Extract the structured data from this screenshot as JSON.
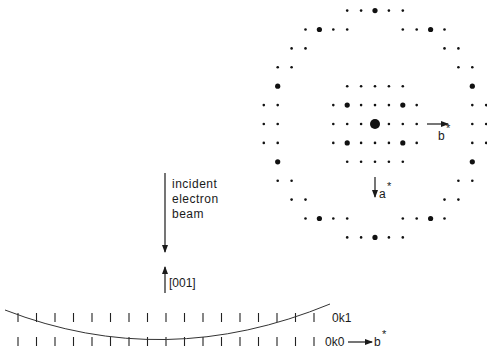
{
  "diagram": {
    "labels": {
      "beam_line1": "incident",
      "beam_line2": "electron",
      "beam_line3": "beam",
      "zone_axis": "[001]",
      "upper_row": "0k1",
      "lower_row": "0k0",
      "b_star_bottom": "b",
      "b_star_bottom_sup": "*",
      "b_star_pattern": "b",
      "b_star_pattern_sup": "*",
      "a_star_pattern": "a",
      "a_star_pattern_sup": "*"
    },
    "pattern": {
      "center": [
        375,
        124
      ],
      "col_spacing": 13.9,
      "row_spacing": 18.9,
      "description": "Electron diffraction pattern: central 0k0 zone (inner square grid) surrounded by a ring of first-order Laue zone reflections",
      "spots": [
        {
          "row": -6,
          "cols": [
            -2,
            -1,
            0,
            1,
            2
          ],
          "strong": [
            0
          ]
        },
        {
          "row": -5,
          "cols": [
            -5,
            -4,
            -3,
            -2,
            2,
            3,
            4,
            5
          ],
          "strong": [
            -4,
            4
          ]
        },
        {
          "row": -4,
          "cols": [
            -6,
            -5,
            5,
            6
          ],
          "strong": []
        },
        {
          "row": -3,
          "cols": [
            -7,
            -6,
            6,
            7
          ],
          "strong": []
        },
        {
          "row": -2,
          "cols": [
            -7,
            -2,
            -1,
            0,
            1,
            2,
            7
          ],
          "strong": [
            -7,
            7
          ]
        },
        {
          "row": -1,
          "cols": [
            -8,
            -7,
            -3,
            -2,
            -1,
            0,
            1,
            2,
            3,
            7,
            8
          ],
          "strong": [
            -2,
            2
          ]
        },
        {
          "row": 0,
          "cols": [
            -8,
            -7,
            -3,
            -2,
            -1,
            0,
            1,
            2,
            3,
            7,
            8
          ],
          "strong": [],
          "central": [
            0
          ]
        },
        {
          "row": 1,
          "cols": [
            -8,
            -7,
            -3,
            -2,
            -1,
            0,
            1,
            2,
            3,
            7,
            8
          ],
          "strong": [
            -2,
            2
          ]
        },
        {
          "row": 2,
          "cols": [
            -7,
            -2,
            -1,
            0,
            1,
            2,
            7
          ],
          "strong": [
            -7,
            7
          ]
        },
        {
          "row": 3,
          "cols": [
            -7,
            -6,
            6,
            7
          ],
          "strong": []
        },
        {
          "row": 4,
          "cols": [
            -6,
            -5,
            5,
            6
          ],
          "strong": []
        },
        {
          "row": 5,
          "cols": [
            -5,
            -4,
            -3,
            -2,
            2,
            3,
            4,
            5
          ],
          "strong": [
            -4,
            4
          ]
        },
        {
          "row": 6,
          "cols": [
            -2,
            -1,
            0,
            1,
            2
          ],
          "strong": [
            0
          ]
        }
      ]
    },
    "reciprocal_rows": {
      "tick_spacing": 18.5,
      "tick_start_x": 18,
      "tick_count": 17,
      "upper_row_y": [
        313,
        322
      ],
      "lower_row_y": [
        337,
        346
      ]
    },
    "ewald_arc": {
      "start": [
        5,
        310
      ],
      "control": [
        165,
        372
      ],
      "end": [
        330,
        304
      ]
    }
  }
}
